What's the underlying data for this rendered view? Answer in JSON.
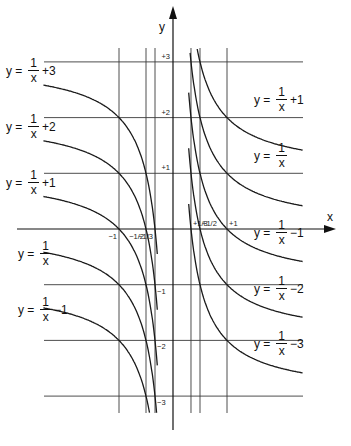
{
  "chart_data": {
    "type": "line",
    "title": "",
    "xlabel": "x",
    "ylabel": "y",
    "x_ticks": [
      {
        "value": -1,
        "label": "−1"
      },
      {
        "value": -0.5,
        "label": "−1/2"
      },
      {
        "value": -0.3333,
        "label": "−1/3"
      },
      {
        "value": 0.3333,
        "label": "+1/3"
      },
      {
        "value": 0.5,
        "label": "+1/2"
      },
      {
        "value": 1,
        "label": "+1"
      }
    ],
    "y_ticks": [
      {
        "value": 3,
        "label": "+3"
      },
      {
        "value": 2,
        "label": "+2"
      },
      {
        "value": 1,
        "label": "+1"
      },
      {
        "value": -1,
        "label": "−1"
      },
      {
        "value": -2,
        "label": "−2"
      },
      {
        "value": -3,
        "label": "−3"
      }
    ],
    "grid": true,
    "xlim": [
      -2.9,
      3.0
    ],
    "ylim": [
      -3.3,
      3.3
    ],
    "series": [
      {
        "name": "y = 1/x + 3",
        "offset": 3,
        "branch": "left"
      },
      {
        "name": "y = 1/x + 2",
        "offset": 2,
        "branch": "left"
      },
      {
        "name": "y = 1/x + 1",
        "offset": 1,
        "branch": "both"
      },
      {
        "name": "y = 1/x",
        "offset": 0,
        "branch": "both"
      },
      {
        "name": "y = 1/x − 1",
        "offset": -1,
        "branch": "both"
      },
      {
        "name": "y = 1/x − 2",
        "offset": -2,
        "branch": "right"
      },
      {
        "name": "y = 1/x − 3",
        "offset": -3,
        "branch": "right"
      }
    ],
    "left_branch_domain": [
      -2.4,
      -0.29
    ],
    "right_branch_domain": [
      0.29,
      2.4
    ]
  },
  "labels": {
    "left": [
      {
        "prefix": "y =",
        "num": "1",
        "den": "x",
        "suffix": "+3",
        "top": 70
      },
      {
        "prefix": "y =",
        "num": "1",
        "den": "x",
        "suffix": "+2",
        "top": 126
      },
      {
        "prefix": "y =",
        "num": "1",
        "den": "x",
        "suffix": "+1",
        "top": 182
      },
      {
        "prefix": "y =",
        "num": "1",
        "den": "x",
        "suffix": "",
        "top": 253
      },
      {
        "prefix": "y =",
        "num": "1",
        "den": "x",
        "suffix": "−1",
        "top": 309
      }
    ],
    "right": [
      {
        "prefix": "y =",
        "num": "1",
        "den": "x",
        "suffix": "+1",
        "top": 99
      },
      {
        "prefix": "y =",
        "num": "1",
        "den": "x",
        "suffix": "",
        "top": 155
      },
      {
        "prefix": "y =",
        "num": "1",
        "den": "x",
        "suffix": "−1",
        "top": 232
      },
      {
        "prefix": "y =",
        "num": "1",
        "den": "x",
        "suffix": "−2",
        "top": 288
      },
      {
        "prefix": "y =",
        "num": "1",
        "den": "x",
        "suffix": "−3",
        "top": 343
      }
    ]
  }
}
